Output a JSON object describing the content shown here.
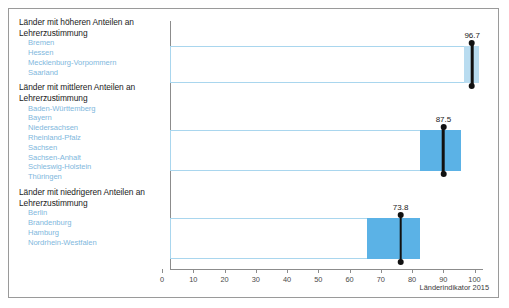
{
  "footer": {
    "source": "Länderindikator 2015"
  },
  "legend": {
    "groups": [
      {
        "title": "Länder mit höheren Anteilen an Lehrerzustimmung",
        "states": [
          "Bremen",
          "Hessen",
          "Mecklenburg-Vorpommern",
          "Saarland"
        ]
      },
      {
        "title": "Länder mit mittleren Anteilen an Lehrerzustimmung",
        "states": [
          "Baden-Württemberg",
          "Bayern",
          "Niedersachsen",
          "Rheinland-Pfalz",
          "Sachsen",
          "Sachsen-Anhalt",
          "Schleswig-Holstein",
          "Thüringen"
        ]
      },
      {
        "title": "Länder mit niedrigeren Anteilen an Lehrerzustimmung",
        "states": [
          "Berlin",
          "Brandenburg",
          "Hamburg",
          "Nordrhein-Westfalen"
        ]
      }
    ]
  },
  "colors": {
    "segment_light": "#b9dcf0",
    "segment_dark": "#5bb2e6",
    "outline": "#a9d6ee",
    "marker": "#111111",
    "axis": "#8c8c8c",
    "state_text": "#7fb8dd"
  },
  "chart_data": {
    "type": "bar",
    "title": "",
    "xlabel": "",
    "ylabel": "",
    "xlim": [
      0,
      100
    ],
    "grid": false,
    "legend_position": "left",
    "ticks": [
      0,
      10,
      20,
      30,
      40,
      50,
      60,
      70,
      80,
      90,
      100
    ],
    "tick_labels": [
      "0",
      "10",
      "20",
      "30",
      "40",
      "50",
      "60",
      "70",
      "80",
      "90",
      "100"
    ],
    "categories": [
      "Länder mit höheren Anteilen an Lehrerzustimmung",
      "Länder mit mittleren Anteilen an Lehrerzustimmung",
      "Länder mit niedrigeren Anteilen an Lehrerzustimmung"
    ],
    "values": [
      96.7,
      87.5,
      73.8
    ],
    "value_labels": [
      "96.7",
      "87.5",
      "73.8"
    ],
    "bars": [
      {
        "label": "96.7",
        "value": 96.7,
        "bar_end": 99.0,
        "segment_start": 94.2,
        "segment_end": 99.0,
        "segment_color": "#b9dcf0"
      },
      {
        "label": "87.5",
        "value": 87.5,
        "bar_end": 93.0,
        "segment_start": 80.0,
        "segment_end": 93.0,
        "segment_color": "#5bb2e6"
      },
      {
        "label": "73.8",
        "value": 73.8,
        "bar_end": 80.0,
        "segment_start": 63.0,
        "segment_end": 80.0,
        "segment_color": "#5bb2e6"
      }
    ]
  }
}
